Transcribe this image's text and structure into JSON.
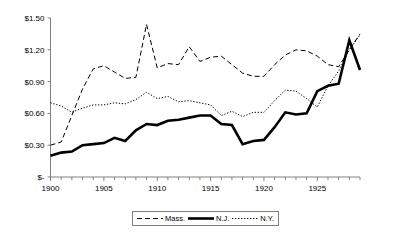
{
  "chart_data": {
    "type": "line",
    "title": "",
    "subtitle": "",
    "xlabel": "",
    "ylabel": "",
    "xlim": [
      1900,
      1929
    ],
    "ylim": [
      0,
      1.5
    ],
    "grid": false,
    "legend_position": "bottom",
    "y_ticks": [
      0,
      0.3,
      0.6,
      0.9,
      1.2,
      1.5
    ],
    "y_tick_labels": [
      "$-",
      "$0.30",
      "$0.60",
      "$0.90",
      "$1.20",
      "$1.50"
    ],
    "x_ticks": [
      1900,
      1905,
      1910,
      1915,
      1920,
      1925
    ],
    "x_tick_labels": [
      "1900",
      "1905",
      "1910",
      "1915",
      "1920",
      "1925"
    ],
    "x_minor_tick_interval": 1,
    "x": [
      1900,
      1901,
      1902,
      1903,
      1904,
      1905,
      1906,
      1907,
      1908,
      1909,
      1910,
      1911,
      1912,
      1913,
      1914,
      1915,
      1916,
      1917,
      1918,
      1919,
      1920,
      1921,
      1922,
      1923,
      1924,
      1925,
      1926,
      1927,
      1928,
      1929
    ],
    "series": [
      {
        "name": "Mass.",
        "style": "dashed",
        "color": "#000000",
        "values": [
          0.3,
          0.33,
          0.58,
          0.83,
          1.02,
          1.05,
          0.99,
          0.93,
          0.94,
          1.44,
          1.03,
          1.07,
          1.06,
          1.23,
          1.09,
          1.13,
          1.14,
          1.06,
          0.98,
          0.95,
          0.95,
          1.06,
          1.15,
          1.2,
          1.19,
          1.14,
          1.06,
          1.04,
          1.2,
          1.35
        ]
      },
      {
        "name": "N.J.",
        "style": "solid-thick",
        "color": "#000000",
        "values": [
          0.2,
          0.23,
          0.24,
          0.3,
          0.31,
          0.32,
          0.37,
          0.34,
          0.44,
          0.5,
          0.49,
          0.53,
          0.54,
          0.56,
          0.58,
          0.58,
          0.5,
          0.49,
          0.31,
          0.34,
          0.35,
          0.47,
          0.61,
          0.59,
          0.6,
          0.81,
          0.86,
          0.88,
          1.29,
          1.01
        ]
      },
      {
        "name": "N.Y.",
        "style": "dotted",
        "color": "#000000",
        "values": [
          0.7,
          0.67,
          0.61,
          0.65,
          0.68,
          0.68,
          0.7,
          0.69,
          0.73,
          0.8,
          0.74,
          0.76,
          0.71,
          0.72,
          0.7,
          0.68,
          0.58,
          0.62,
          0.57,
          0.61,
          0.61,
          0.72,
          0.82,
          0.81,
          0.74,
          0.66,
          0.86,
          1.0,
          1.2,
          1.34
        ]
      }
    ]
  },
  "legend": {
    "items": [
      {
        "label": "Mass.",
        "style": "dashed"
      },
      {
        "label": "N.J.",
        "style": "solid-thick"
      },
      {
        "label": "N.Y.",
        "style": "dotted"
      }
    ]
  },
  "colors": {
    "line": "#000000",
    "axis": "#808080",
    "background": "#ffffff",
    "legend_border": "#808080"
  }
}
